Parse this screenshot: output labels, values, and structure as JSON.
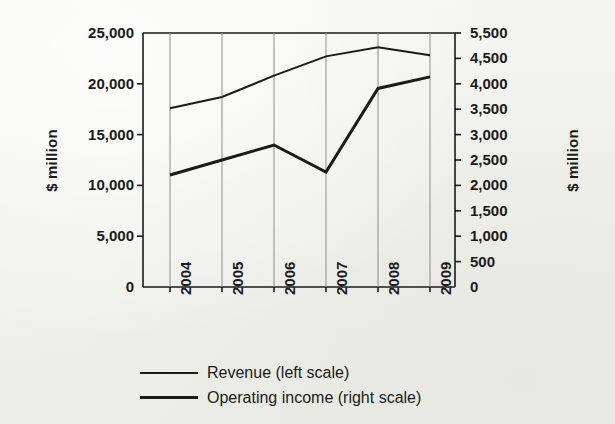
{
  "chart_data": {
    "type": "line",
    "title": "",
    "subtitle": "",
    "xlabel": "",
    "ylabel": "$ million",
    "ylabel_right": "$ million",
    "categories": [
      "2004",
      "2005",
      "2006",
      "2007",
      "2008",
      "2009"
    ],
    "x_tick_rotation": -90,
    "grid": "vertical-only",
    "legend_position": "bottom-left",
    "ylim": [
      0,
      25000
    ],
    "ylim_right": [
      0,
      5500
    ],
    "y_ticks_left": [
      "0",
      "5,000",
      "10,000",
      "15,000",
      "20,000",
      "25,000"
    ],
    "y_tick_values_left": [
      0,
      5000,
      10000,
      15000,
      20000,
      25000
    ],
    "y_ticks_right": [
      "0",
      "500",
      "1,000",
      "1,500",
      "2,000",
      "2,500",
      "3,000",
      "3,500",
      "4,000",
      "4,500",
      "5,500"
    ],
    "y_tick_values_right": [
      0,
      500,
      1000,
      1500,
      2000,
      2500,
      3000,
      3500,
      4000,
      4500,
      5500
    ],
    "series": [
      {
        "name": "Revenue (left scale)",
        "axis": "left",
        "stroke": "#1a1a1a",
        "width": 2,
        "values": [
          17600,
          18700,
          20800,
          22700,
          23600,
          22800
        ]
      },
      {
        "name": "Operating income (right scale)",
        "axis": "right",
        "stroke": "#1a1a1a",
        "width": 3,
        "values": [
          2425,
          2750,
          3075,
          2490,
          4300,
          4550
        ]
      }
    ]
  },
  "legend": {
    "items": [
      {
        "label": "Revenue (left scale)",
        "swatch": "thin-line-swatch"
      },
      {
        "label": "Operating income (right scale)",
        "swatch": "thick-line-swatch"
      }
    ]
  },
  "style": {
    "background": "#f4f4f1",
    "ink": "#1a1a1a",
    "grid": "#8c8c8c"
  }
}
